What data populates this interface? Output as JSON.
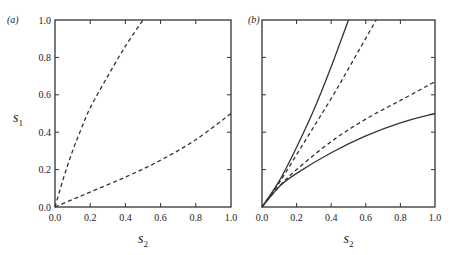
{
  "chart_data": [
    {
      "type": "line",
      "panel_label": "(a)",
      "xlabel": "s2",
      "ylabel": "s1",
      "xlim": [
        0,
        1
      ],
      "ylim": [
        0,
        1
      ],
      "xticks": [
        "0.0",
        "0.2",
        "0.4",
        "0.6",
        "0.8",
        "1.0"
      ],
      "yticks": [
        "0.0",
        "0.2",
        "0.4",
        "0.6",
        "0.8",
        "1.0"
      ],
      "grid": false,
      "series": [
        {
          "name": "upper-dashed",
          "style": "dashed",
          "x": [
            0,
            0.05,
            0.1,
            0.15,
            0.2,
            0.3,
            0.4,
            0.5
          ],
          "y": [
            0,
            0.16,
            0.3,
            0.42,
            0.53,
            0.7,
            0.86,
            1.0
          ]
        },
        {
          "name": "lower-dashed",
          "style": "dashed",
          "x": [
            0,
            0.1,
            0.2,
            0.4,
            0.6,
            0.8,
            1.0
          ],
          "y": [
            0,
            0.04,
            0.08,
            0.16,
            0.25,
            0.36,
            0.5
          ]
        }
      ]
    },
    {
      "type": "line",
      "panel_label": "(b)",
      "xlabel": "s2",
      "ylabel": "",
      "xlim": [
        0,
        1
      ],
      "ylim": [
        0,
        1
      ],
      "xticks": [
        "0.0",
        "0.2",
        "0.4",
        "0.6",
        "0.8",
        "1.0"
      ],
      "yticks": [],
      "grid": false,
      "series": [
        {
          "name": "upper-solid",
          "style": "solid",
          "x": [
            0,
            0.1,
            0.2,
            0.3,
            0.4,
            0.5
          ],
          "y": [
            0,
            0.14,
            0.32,
            0.52,
            0.75,
            1.0
          ]
        },
        {
          "name": "upper-dashed",
          "style": "dashed",
          "x": [
            0,
            0.1,
            0.2,
            0.3,
            0.4,
            0.5,
            0.66
          ],
          "y": [
            0,
            0.13,
            0.28,
            0.43,
            0.58,
            0.74,
            1.0
          ]
        },
        {
          "name": "lower-dashed",
          "style": "dashed",
          "x": [
            0,
            0.1,
            0.2,
            0.4,
            0.6,
            0.8,
            1.0
          ],
          "y": [
            0,
            0.11,
            0.2,
            0.35,
            0.47,
            0.57,
            0.67
          ]
        },
        {
          "name": "lower-solid",
          "style": "solid",
          "x": [
            0,
            0.1,
            0.2,
            0.4,
            0.6,
            0.8,
            1.0
          ],
          "y": [
            0,
            0.11,
            0.18,
            0.29,
            0.38,
            0.45,
            0.5
          ]
        }
      ]
    }
  ]
}
